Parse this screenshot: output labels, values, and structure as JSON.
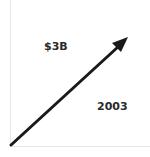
{
  "diagram": {
    "value_label": "$3B",
    "year_label": "2003",
    "arrow": {
      "start": [
        11,
        145
      ],
      "end": [
        127,
        38
      ],
      "color": "#1a1a1a"
    },
    "axis_color": "#e6e6e6"
  }
}
